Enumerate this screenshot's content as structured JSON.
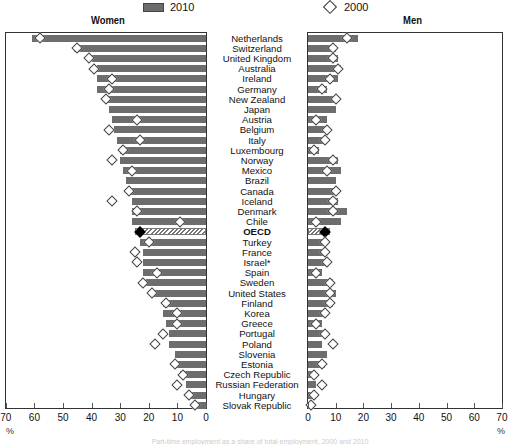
{
  "legend": {
    "bar_label": "2010",
    "marker_label": "2000"
  },
  "panels": {
    "left_title": "Women",
    "right_title": "Men"
  },
  "axis": {
    "left_ticks": [
      "70",
      "60",
      "50",
      "40",
      "30",
      "20",
      "10",
      "0"
    ],
    "right_ticks": [
      "0",
      "10",
      "20",
      "30",
      "40",
      "50",
      "60",
      "70"
    ],
    "unit": "%"
  },
  "caption": "Part-time employment as a share of total employment, 2000 and 2010",
  "colors": {
    "bar": "#6d6d6d",
    "marker": "#ffffff",
    "oecd_marker": "#000000"
  },
  "chart_data": {
    "type": "bar",
    "orientation": "horizontal",
    "layout": "back-to-back (Women left, Men right)",
    "xlabel": "%",
    "xlim": [
      0,
      70
    ],
    "legend": [
      "2010 (bars)",
      "2000 (diamonds)"
    ],
    "categories": [
      "Netherlands",
      "Switzerland",
      "United Kingdom",
      "Australia",
      "Ireland",
      "Germany",
      "New Zealand",
      "Japan",
      "Austria",
      "Belgium",
      "Italy",
      "Luxembourg",
      "Norway",
      "Mexico",
      "Brazil",
      "Canada",
      "Iceland",
      "Denmark",
      "Chile",
      "OECD",
      "Turkey",
      "France",
      "Israel*",
      "Spain",
      "Sweden",
      "United States",
      "Finland",
      "Korea",
      "Greece",
      "Portugal",
      "Poland",
      "Slovenia",
      "Estonia",
      "Czech Republic",
      "Russian Federation",
      "Hungary",
      "Slovak Republic"
    ],
    "series": [
      {
        "name": "Women 2010",
        "values": [
          61,
          46,
          40,
          38,
          38,
          38,
          35,
          34,
          33,
          32,
          31,
          30,
          30,
          29,
          28,
          27,
          26,
          26,
          26,
          25,
          23,
          22,
          22,
          22,
          21,
          19,
          15,
          15,
          14,
          13,
          13,
          11,
          11,
          9,
          7,
          6,
          5
        ]
      },
      {
        "name": "Women 2000",
        "values": [
          58,
          45,
          41,
          39,
          33,
          34,
          35,
          null,
          24,
          34,
          23,
          29,
          33,
          26,
          null,
          27,
          33,
          24,
          9,
          23,
          20,
          25,
          24,
          17,
          22,
          19,
          14,
          10,
          10,
          15,
          18,
          null,
          11,
          8,
          10,
          6,
          4
        ]
      },
      {
        "name": "Men 2010",
        "values": [
          18,
          10,
          11,
          12,
          11,
          7,
          11,
          10,
          7,
          7,
          6,
          4,
          11,
          12,
          10,
          11,
          11,
          14,
          12,
          8,
          6,
          6,
          6,
          5,
          9,
          10,
          9,
          7,
          5,
          6,
          5,
          7,
          6,
          2,
          3,
          2,
          2
        ]
      },
      {
        "name": "Men 2000",
        "values": [
          14,
          9,
          9,
          11,
          8,
          5,
          10,
          null,
          3,
          7,
          6,
          2,
          9,
          7,
          null,
          10,
          9,
          9,
          3,
          6,
          6,
          6,
          7,
          3,
          8,
          8,
          8,
          6,
          3,
          6,
          9,
          null,
          5,
          2,
          5,
          2,
          1
        ]
      }
    ]
  }
}
